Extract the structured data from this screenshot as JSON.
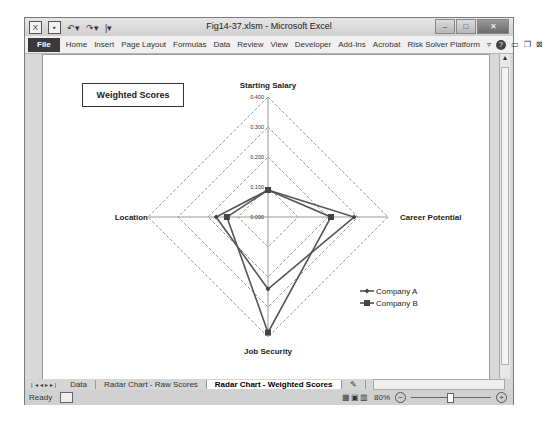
{
  "window": {
    "title": "Fig14-37.xlsm - Microsoft Excel",
    "quick_access": [
      "excel-logo",
      "save",
      "undo",
      "redo",
      "customize"
    ]
  },
  "ribbon": {
    "file": "File",
    "tabs": [
      "Home",
      "Insert",
      "Page Layout",
      "Formulas",
      "Data",
      "Review",
      "View",
      "Developer",
      "Add-Ins",
      "Acrobat",
      "Risk Solver Platform"
    ]
  },
  "sheet_tabs": {
    "items": [
      "Data",
      "Radar Chart - Raw Scores",
      "Radar Chart - Weighted Scores"
    ],
    "active": "Radar Chart - Weighted Scores"
  },
  "status": {
    "ready": "Ready",
    "zoom": "80%"
  },
  "chart_data": {
    "type": "radar",
    "title": "Weighted Scores",
    "categories": [
      "Starting Salary",
      "Career Potential",
      "Job Security",
      "Location"
    ],
    "rlim": [
      0,
      0.4
    ],
    "ticks": [
      "0.000",
      "0.100",
      "0.200",
      "0.300",
      "0.400"
    ],
    "tick_values": [
      0,
      0.1,
      0.2,
      0.3,
      0.4
    ],
    "series": [
      {
        "name": "Company A",
        "marker": "diamond",
        "values": [
          0.09,
          0.287,
          0.24,
          0.173
        ]
      },
      {
        "name": "Company B",
        "marker": "square",
        "values": [
          0.09,
          0.21,
          0.385,
          0.137
        ]
      }
    ],
    "legend_position": "right",
    "grid": true
  }
}
